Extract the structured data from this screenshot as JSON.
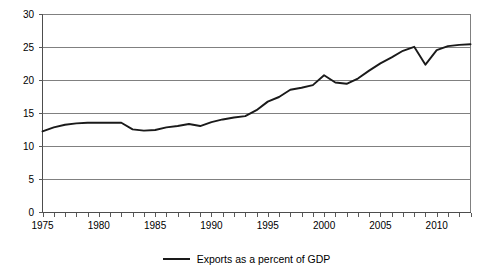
{
  "chart_data": {
    "type": "line",
    "title": "",
    "subtitle": "",
    "xlabel": "",
    "ylabel": "",
    "xlim": [
      1975,
      2013
    ],
    "ylim": [
      0,
      30
    ],
    "ytick_step": 5,
    "yticks": [
      0,
      5,
      10,
      15,
      20,
      25,
      30
    ],
    "ytick_labels": [
      "0",
      "5",
      "10",
      "15",
      "20",
      "25",
      "30"
    ],
    "xticks": [
      1975,
      1980,
      1985,
      1990,
      1995,
      2000,
      2005,
      2010
    ],
    "xtick_labels": [
      "1975",
      "1980",
      "1985",
      "1990",
      "1995",
      "2000",
      "2005",
      "2010"
    ],
    "xtick_minor_step": 1,
    "grid": true,
    "grid_axis": "y",
    "legend_position": "bottom-center",
    "series": [
      {
        "name": "Exports as a percent of GDP",
        "color": "#1a1a1a",
        "x": [
          1975,
          1976,
          1977,
          1978,
          1979,
          1980,
          1981,
          1982,
          1983,
          1984,
          1985,
          1986,
          1987,
          1988,
          1989,
          1990,
          1991,
          1992,
          1993,
          1994,
          1995,
          1996,
          1997,
          1998,
          1999,
          2000,
          2001,
          2002,
          2003,
          2004,
          2005,
          2006,
          2007,
          2008,
          2009,
          2010,
          2011,
          2012,
          2013
        ],
        "values": [
          12.3,
          12.9,
          13.3,
          13.5,
          13.6,
          13.6,
          13.6,
          13.6,
          12.6,
          12.4,
          12.5,
          12.9,
          13.1,
          13.4,
          13.1,
          13.7,
          14.1,
          14.4,
          14.6,
          15.5,
          16.8,
          17.5,
          18.6,
          18.9,
          19.3,
          20.8,
          19.7,
          19.5,
          20.3,
          21.5,
          22.6,
          23.5,
          24.5,
          25.1,
          22.4,
          24.6,
          25.2,
          25.4,
          25.5
        ]
      }
    ],
    "legend": [
      {
        "label": "Exports as a percent of GDP",
        "color": "#1a1a1a",
        "marker": "line"
      }
    ]
  },
  "legend": {
    "entry_label": "Exports as a percent of GDP"
  }
}
